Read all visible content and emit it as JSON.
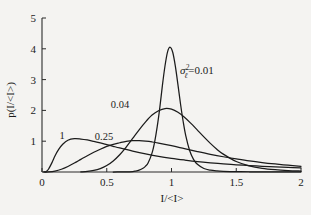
{
  "chart_data": {
    "type": "line",
    "title": "",
    "subtitle": "",
    "xlabel": "I/<I>",
    "ylabel": "p(I/<I>)",
    "xlim": [
      0,
      2
    ],
    "ylim": [
      0,
      5
    ],
    "xticks": [
      "0",
      "0.5",
      "1",
      "1.5",
      "2"
    ],
    "xtick_values": [
      0,
      0.5,
      1,
      1.5,
      2
    ],
    "yticks": [
      "1",
      "2",
      "3",
      "4",
      "5"
    ],
    "ytick_values": [
      1,
      2,
      3,
      4,
      5
    ],
    "grid": false,
    "legend_position": "inline-annotations",
    "annotations": [
      {
        "name": "sigma-equation",
        "sigma": "σ",
        "superscript": "2",
        "subscript": "ℓ",
        "equals": "=0.01",
        "text": "σℓ²=0.01",
        "x": 1.08,
        "y": 3.05
      },
      {
        "name": "curve-label-004",
        "text": "0.04",
        "x": 0.77,
        "y": 2.28
      },
      {
        "name": "curve-label-025",
        "text": "0.25",
        "x": 0.53,
        "y": 1.35
      },
      {
        "name": "curve-label-1",
        "text": "1",
        "x": 0.21,
        "y": 1.38
      }
    ],
    "series": [
      {
        "name": "sigma^2 = 0.01",
        "label": "0.01",
        "sigma2": 0.01,
        "peak_x": 0.99,
        "peak_y": 4.05,
        "x": [
          0.55,
          0.6,
          0.65,
          0.7,
          0.72,
          0.75,
          0.78,
          0.8,
          0.82,
          0.85,
          0.87,
          0.89,
          0.91,
          0.93,
          0.95,
          0.97,
          0.99,
          1.01,
          1.03,
          1.05,
          1.07,
          1.09,
          1.11,
          1.14,
          1.17,
          1.2,
          1.25,
          1.3,
          1.35,
          1.4,
          1.5,
          1.6,
          1.75,
          2.0
        ],
        "y": [
          0.0,
          0.001,
          0.004,
          0.016,
          0.028,
          0.06,
          0.12,
          0.19,
          0.3,
          0.62,
          0.98,
          1.48,
          2.1,
          2.82,
          3.45,
          3.91,
          4.05,
          3.88,
          3.43,
          2.83,
          2.2,
          1.64,
          1.18,
          0.7,
          0.41,
          0.25,
          0.115,
          0.06,
          0.036,
          0.024,
          0.012,
          0.008,
          0.005,
          0.003
        ]
      },
      {
        "name": "sigma^2 = 0.04",
        "label": "0.04",
        "sigma2": 0.04,
        "peak_x": 0.95,
        "peak_y": 2.06,
        "x": [
          0.3,
          0.35,
          0.4,
          0.45,
          0.5,
          0.55,
          0.6,
          0.65,
          0.7,
          0.75,
          0.8,
          0.85,
          0.9,
          0.95,
          1.0,
          1.05,
          1.1,
          1.15,
          1.2,
          1.25,
          1.3,
          1.35,
          1.4,
          1.5,
          1.6,
          1.7,
          1.8,
          1.9,
          2.0
        ],
        "y": [
          0.005,
          0.018,
          0.05,
          0.11,
          0.21,
          0.36,
          0.56,
          0.81,
          1.09,
          1.37,
          1.63,
          1.85,
          1.99,
          2.06,
          2.04,
          1.94,
          1.78,
          1.58,
          1.36,
          1.14,
          0.93,
          0.74,
          0.58,
          0.34,
          0.2,
          0.12,
          0.075,
          0.048,
          0.032
        ]
      },
      {
        "name": "sigma^2 = 0.25",
        "label": "0.25",
        "sigma2": 0.25,
        "peak_x": 0.7,
        "peak_y": 1.02,
        "x": [
          0.02,
          0.05,
          0.1,
          0.15,
          0.2,
          0.25,
          0.3,
          0.35,
          0.4,
          0.45,
          0.5,
          0.55,
          0.6,
          0.65,
          0.7,
          0.75,
          0.8,
          0.85,
          0.9,
          1.0,
          1.1,
          1.2,
          1.3,
          1.4,
          1.5,
          1.6,
          1.7,
          1.8,
          1.9,
          2.0
        ],
        "y": [
          0.0,
          0.002,
          0.03,
          0.09,
          0.18,
          0.29,
          0.41,
          0.53,
          0.64,
          0.74,
          0.83,
          0.9,
          0.95,
          0.995,
          1.02,
          1.015,
          1.0,
          0.975,
          0.94,
          0.855,
          0.76,
          0.665,
          0.575,
          0.495,
          0.425,
          0.36,
          0.305,
          0.26,
          0.22,
          0.185
        ]
      },
      {
        "name": "sigma^2 = 1",
        "label": "1",
        "sigma2": 1.0,
        "peak_x": 0.25,
        "peak_y": 1.08,
        "x": [
          0.01,
          0.03,
          0.05,
          0.08,
          0.1,
          0.13,
          0.16,
          0.2,
          0.25,
          0.3,
          0.35,
          0.4,
          0.45,
          0.5,
          0.55,
          0.6,
          0.7,
          0.8,
          0.9,
          1.0,
          1.1,
          1.2,
          1.3,
          1.4,
          1.5,
          1.6,
          1.7,
          1.8,
          1.9,
          2.0
        ],
        "y": [
          0.0,
          0.01,
          0.09,
          0.33,
          0.52,
          0.74,
          0.9,
          1.03,
          1.08,
          1.07,
          1.04,
          0.995,
          0.945,
          0.89,
          0.835,
          0.78,
          0.68,
          0.59,
          0.51,
          0.445,
          0.39,
          0.34,
          0.3,
          0.265,
          0.235,
          0.21,
          0.185,
          0.165,
          0.15,
          0.135
        ]
      }
    ]
  },
  "colors": {
    "background": "#f4f3f1",
    "axis": "#2b2b2b",
    "curve": "#1b1b1b",
    "text": "#1b1b1b"
  }
}
